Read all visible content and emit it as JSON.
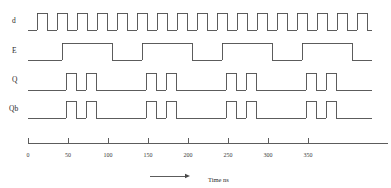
{
  "figure": {
    "background": "#ffffff",
    "line_color": "#4a4a4a",
    "axis_color": "#4a4a4a",
    "text_color": "#2b2b2b"
  },
  "signals": [
    {
      "name": "d",
      "label": "d",
      "label_x": 12,
      "label_y": 17,
      "low_y": 30,
      "high_y": 13
    },
    {
      "name": "E",
      "label": "E",
      "label_x": 12,
      "label_y": 47,
      "low_y": 60,
      "high_y": 43
    },
    {
      "name": "Q",
      "label": "Q",
      "label_x": 12,
      "label_y": 76,
      "low_y": 90,
      "high_y": 73
    },
    {
      "name": "Qb",
      "label": "Qb",
      "label_x": 9,
      "label_y": 105,
      "low_y": 118,
      "high_y": 101
    }
  ],
  "axis": {
    "label": "Time ns",
    "label_x": 208,
    "label_y": 177,
    "arrow_x1": 150,
    "arrow_x2": 190,
    "arrow_y": 176,
    "line_y": 143,
    "line_x1": 28,
    "line_x2": 388,
    "tick_length": 5,
    "ticks": [
      {
        "value": "0",
        "x": 28
      },
      {
        "value": "50",
        "x": 68
      },
      {
        "value": "100",
        "x": 108
      },
      {
        "value": "150",
        "x": 148
      },
      {
        "value": "200",
        "x": 188
      },
      {
        "value": "250",
        "x": 228
      },
      {
        "value": "300",
        "x": 268
      },
      {
        "value": "350",
        "x": 308
      }
    ],
    "tick_label_y": 152
  },
  "waveforms": {
    "x_start": 28,
    "x_end": 372,
    "d": {
      "transitions": [
        37,
        47,
        57,
        67,
        77,
        87,
        97,
        107,
        117,
        127,
        137,
        147,
        157,
        167,
        177,
        187,
        197,
        207,
        217,
        227,
        237,
        247,
        257,
        267,
        277,
        287,
        297,
        307,
        317,
        327,
        337,
        347,
        357,
        367
      ],
      "start_level": 0
    },
    "E": {
      "transitions": [
        62,
        112,
        142,
        192,
        222,
        272,
        302,
        352
      ],
      "start_level": 0
    },
    "Q": {
      "transitions": [
        66,
        76,
        86,
        96,
        146,
        156,
        166,
        176,
        226,
        236,
        246,
        256,
        306,
        316,
        326,
        336
      ],
      "start_level": 0
    },
    "Qb": {
      "transitions": [
        66,
        76,
        86,
        96,
        146,
        156,
        166,
        176,
        226,
        236,
        246,
        256,
        306,
        316,
        326,
        336
      ],
      "start_level": 0
    }
  }
}
